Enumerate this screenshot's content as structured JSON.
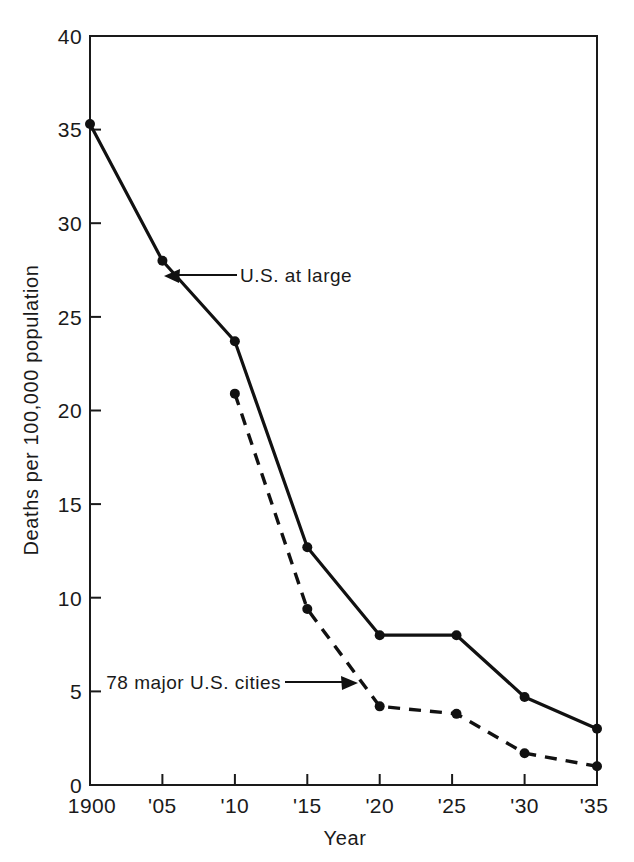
{
  "chart_data": {
    "type": "line",
    "title": "",
    "subtitle": "",
    "xlabel": "Year",
    "ylabel": "Deaths per 100,000 population",
    "x": [
      1900,
      1905,
      1910,
      1915,
      1920,
      1925,
      1930,
      1935
    ],
    "xtick_labels": [
      "1900",
      "'05",
      "'10",
      "'15",
      "'20",
      "'25",
      "'30",
      "'35"
    ],
    "ytick_labels": [
      "0",
      "5",
      "10",
      "15",
      "20",
      "25",
      "30",
      "35",
      "40"
    ],
    "ytick_values": [
      0,
      5,
      10,
      15,
      20,
      25,
      30,
      35,
      40
    ],
    "xlim": [
      1900,
      1935
    ],
    "ylim": [
      0,
      40
    ],
    "grid": false,
    "legend_position": "none",
    "series": [
      {
        "name": "U.S. at large",
        "style": "solid",
        "marker": "filled-circle",
        "x": [
          1900,
          1905,
          1910,
          1915,
          1920,
          1925.3,
          1930,
          1935
        ],
        "values": [
          35.3,
          28.0,
          23.7,
          12.7,
          8.0,
          8.0,
          4.7,
          3.0
        ]
      },
      {
        "name": "78 major U.S. cities",
        "style": "dashed",
        "marker": "filled-circle",
        "x": [
          1910,
          1915,
          1920,
          1925.3,
          1930,
          1935
        ],
        "values": [
          20.9,
          9.4,
          4.2,
          3.8,
          1.7,
          1.0
        ]
      }
    ],
    "annotations": [
      {
        "text": "U.S. at large",
        "target_x": 1905.8,
        "target_y": 27.2,
        "arrow_direction": "left"
      },
      {
        "text": "78 major U.S. cities",
        "target_x": 1919.0,
        "target_y": 5.6,
        "arrow_direction": "right"
      }
    ]
  }
}
